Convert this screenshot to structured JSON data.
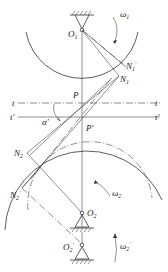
{
  "diagram": {
    "type": "gear-mesh-center-distance-change",
    "labels": {
      "O1": "O",
      "O1_sub": "1",
      "omega1": "ω",
      "omega1_sub": "1",
      "N1prime": "N",
      "N1prime_sub": "1",
      "N1prime_mark": "′",
      "N1": "N",
      "N1_sub": "1",
      "P": "P",
      "Pprime": "P′",
      "t_left": "t",
      "t_right": "t",
      "tprime_left": "t′",
      "tprime_right": "t′",
      "alpha_prime": "α′",
      "N2": "N",
      "N2_sub": "2",
      "N2prime": "N",
      "N2prime_sub": "2",
      "N2prime_mark": "′",
      "O2": "O",
      "O2_sub": "2",
      "omega2": "ω",
      "omega2_sub": "2",
      "O2prime": "O",
      "O2prime_sub": "2",
      "O2prime_mark": "′",
      "omega2prime": "ω",
      "omega2prime_sub": "2",
      "omega2prime_mark": "′"
    },
    "colors": {
      "line": "#333333",
      "background": "#ffffff"
    }
  }
}
